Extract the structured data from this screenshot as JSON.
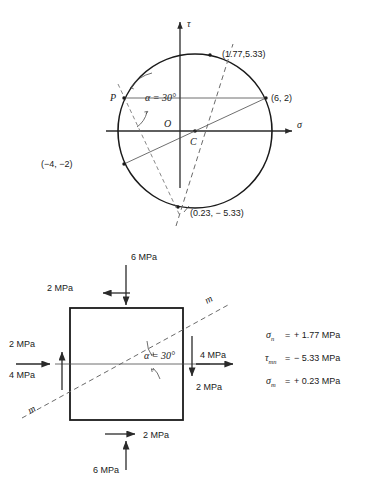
{
  "figure": {
    "caption": ""
  },
  "mohr": {
    "axis_tau_label": "τ",
    "axis_sigma_label": "σ",
    "origin_label": "O",
    "center_label": "C",
    "point_p_label": "P",
    "angle_label": "α = 30°",
    "points": [
      {
        "name": "top-right-point",
        "label": "(1.77,5.33)",
        "sigma": 1.77,
        "tau": 5.33
      },
      {
        "name": "right-point",
        "label": "(6, 2)",
        "sigma": 6,
        "tau": 2
      },
      {
        "name": "left-point",
        "label": "(−4, −2)",
        "sigma": -4,
        "tau": -2
      },
      {
        "name": "bottom-point",
        "label": "(0.23, − 5.33)",
        "sigma": 0.23,
        "tau": -5.33
      }
    ]
  },
  "element": {
    "angle_label": "α = 30°",
    "plane_label_upper": "m",
    "plane_label_lower": "m",
    "loads": {
      "top_normal": "6 MPa",
      "top_shear": "2 MPa",
      "left_shear": "2 MPa",
      "left_normal": "4 MPa",
      "right_normal": "4 MPa",
      "right_shear": "2 MPa",
      "bottom_shear": "2 MPa",
      "bottom_normal": "6 MPa"
    }
  },
  "results": [
    {
      "symbol": "σ",
      "subscript": "n",
      "equals": "=",
      "value": "+ 1.77 MPa"
    },
    {
      "symbol": "τ",
      "subscript": "mn",
      "equals": "=",
      "value": "− 5.33 MPa"
    },
    {
      "symbol": "σ",
      "subscript": "m",
      "equals": "=",
      "value": "+ 0.23 MPa"
    }
  ]
}
